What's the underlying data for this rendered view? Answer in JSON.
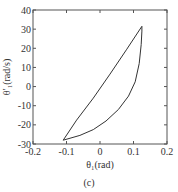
{
  "chart_data": {
    "type": "line",
    "title": "",
    "caption": "(c)",
    "xlabel": "θ₁(rad)",
    "ylabel": "θ′₁(rad/s)",
    "xlim": [
      -0.2,
      0.2
    ],
    "ylim": [
      -30,
      40
    ],
    "xticks": [
      -0.2,
      -0.1,
      0,
      0.1,
      0.2
    ],
    "xtick_labels": [
      "-0.2",
      "-0.1",
      "0",
      "0.1",
      "0.2"
    ],
    "yticks": [
      -30,
      -20,
      -10,
      0,
      10,
      20,
      30,
      40
    ],
    "ytick_labels": [
      "-30",
      "-20",
      "-10",
      "0",
      "10",
      "20",
      "30",
      "40"
    ],
    "grid": false,
    "legend": null,
    "series": [
      {
        "name": "phase trajectory (closed loop)",
        "color": "#333333",
        "x": [
          -0.11,
          -0.06,
          -0.02,
          0.018,
          0.055,
          0.085,
          0.105,
          0.117,
          0.123,
          0.125,
          0.125,
          0.08,
          0.03,
          -0.02,
          -0.07,
          -0.11
        ],
        "y": [
          -28.0,
          -25.5,
          -22.5,
          -18.0,
          -12.0,
          -5.0,
          2.5,
          12.0,
          22.0,
          29.0,
          31.5,
          19.5,
          6.5,
          -6.0,
          -17.5,
          -28.0
        ]
      }
    ]
  }
}
